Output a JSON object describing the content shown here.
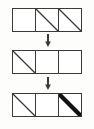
{
  "diagram": {
    "colors": {
      "stroke": "#3a3a3a",
      "bold_stroke": "#111111",
      "cell_fill": "#ffffff",
      "background": "#fdfdfb"
    },
    "stroke_widths": {
      "border": 1.4,
      "diagonal_thin": 1.3,
      "diagonal_bold": 4.2
    },
    "arrow_glyph": "down-arrow",
    "rows": [
      {
        "id": "row-1",
        "label": "top row",
        "cells": [
          {
            "id": "r1c1",
            "content": "empty",
            "diagonal": "none",
            "weight": "none"
          },
          {
            "id": "r1c2",
            "content": "diagonal",
            "diagonal": "backslash",
            "weight": "thin"
          },
          {
            "id": "r1c3",
            "content": "diagonal",
            "diagonal": "backslash",
            "weight": "thin"
          }
        ]
      },
      {
        "id": "row-2",
        "label": "middle row",
        "cells": [
          {
            "id": "r2c1",
            "content": "diagonal",
            "diagonal": "backslash",
            "weight": "thin"
          },
          {
            "id": "r2c2",
            "content": "empty",
            "diagonal": "none",
            "weight": "none"
          },
          {
            "id": "r2c3",
            "content": "empty",
            "diagonal": "none",
            "weight": "none"
          }
        ]
      },
      {
        "id": "row-3",
        "label": "bottom row",
        "cells": [
          {
            "id": "r3c1",
            "content": "diagonal",
            "diagonal": "backslash",
            "weight": "thin"
          },
          {
            "id": "r3c2",
            "content": "empty",
            "diagonal": "none",
            "weight": "none"
          },
          {
            "id": "r3c3",
            "content": "diagonal",
            "diagonal": "backslash",
            "weight": "bold"
          }
        ]
      }
    ],
    "arrows": [
      {
        "id": "arrow-1",
        "direction": "down",
        "between": "row-1 to row-2"
      },
      {
        "id": "arrow-2",
        "direction": "down",
        "between": "row-2 to row-3"
      }
    ]
  }
}
